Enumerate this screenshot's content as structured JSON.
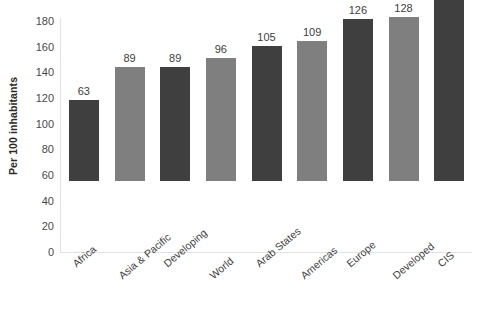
{
  "chart_data": {
    "type": "bar",
    "title": "",
    "subtitle": "",
    "xlabel": "",
    "ylabel": "Per 100 inhabitants",
    "ylim": [
      0,
      180
    ],
    "ytick_step": 20,
    "yticks": [
      180,
      160,
      140,
      120,
      100,
      80,
      60,
      40,
      20,
      0
    ],
    "grid": false,
    "legend": "none",
    "categories": [
      "Africa",
      "Asia & Pacific",
      "Developing",
      "World",
      "Arab States",
      "Americas",
      "Europe",
      "Developed",
      "CIS"
    ],
    "values": [
      63,
      89,
      89,
      96,
      105,
      109,
      126,
      128,
      170
    ],
    "data_labels": [
      "63",
      "89",
      "89",
      "96",
      "105",
      "109",
      "126",
      "128",
      "170"
    ],
    "bar_colors": [
      "#3f3f3f",
      "#7f7f7f",
      "#3f3f3f",
      "#7f7f7f",
      "#3f3f3f",
      "#7f7f7f",
      "#3f3f3f",
      "#7f7f7f",
      "#3f3f3f"
    ]
  },
  "colors": {
    "dark_bar": "#3f3f3f",
    "light_bar": "#7f7f7f",
    "axis_line": "#e2e2e2",
    "tick_text": "#4a4a4a",
    "label_text": "#3d3d3d",
    "background": "#ffffff"
  }
}
